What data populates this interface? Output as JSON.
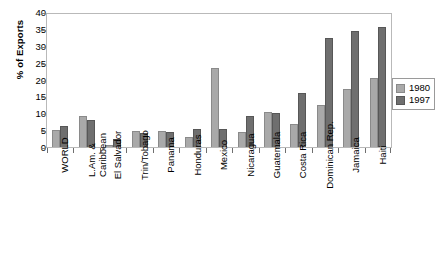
{
  "chart_data": {
    "type": "bar",
    "title": "",
    "xlabel": "",
    "ylabel": "% of Exports",
    "ylim": [
      0,
      40
    ],
    "yticks": [
      0,
      5,
      10,
      15,
      20,
      25,
      30,
      35,
      40
    ],
    "grid": false,
    "legend_position": "right",
    "categories": [
      "WORLD",
      "L.Am. &\nCaribbean",
      "El Salvador",
      "Trin/Tobago",
      "Panama",
      "Honduras",
      "Mexico",
      "Nicaragua",
      "Guatemala",
      "Costa Rica",
      "Dominican Rep.",
      "Jamaica",
      "Haiti"
    ],
    "series": [
      {
        "name": "1980",
        "color": "#a9a9a9",
        "values": [
          5.0,
          9.4,
          0.7,
          4.7,
          4.9,
          2.9,
          23.7,
          4.5,
          10.4,
          7.0,
          12.6,
          17.4,
          20.8
        ]
      },
      {
        "name": "1997",
        "color": "#6f6f6f",
        "values": [
          6.3,
          8.1,
          2.5,
          4.1,
          4.5,
          5.4,
          5.3,
          9.3,
          10.1,
          16.3,
          32.8,
          34.8,
          36.1
        ]
      }
    ]
  },
  "legend": {
    "entries": [
      {
        "label": "1980"
      },
      {
        "label": "1997"
      }
    ]
  }
}
